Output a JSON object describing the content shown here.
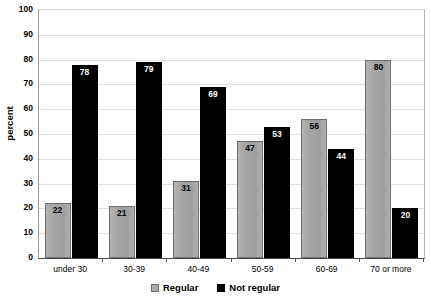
{
  "chart_data": {
    "type": "bar",
    "title": "",
    "xlabel": "",
    "ylabel": "percent",
    "ylim": [
      0,
      100
    ],
    "ytick_step": 10,
    "yticks": [
      100,
      90,
      80,
      70,
      60,
      50,
      40,
      30,
      20,
      10,
      0
    ],
    "grid": true,
    "legend_position": "bottom",
    "categories": [
      "under 30",
      "30-39",
      "40-49",
      "50-59",
      "60-69",
      "70 or more"
    ],
    "series": [
      {
        "name": "Regular",
        "color": "#a8a8a8",
        "values": [
          22,
          21,
          31,
          47,
          56,
          80
        ]
      },
      {
        "name": "Not regular",
        "color": "#000000",
        "values": [
          78,
          79,
          69,
          53,
          44,
          20
        ]
      }
    ],
    "data_labels": true
  },
  "legend": {
    "items": [
      {
        "label": "Regular"
      },
      {
        "label": "Not regular"
      }
    ]
  }
}
